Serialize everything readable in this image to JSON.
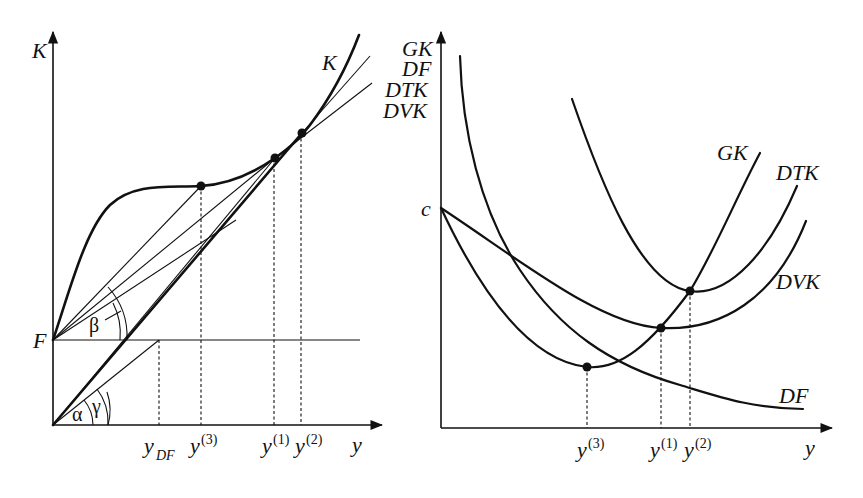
{
  "left_panel": {
    "y_axis_label": "K",
    "x_axis_label": "y",
    "fixed_cost_label": "F",
    "curve_label": "K",
    "angle_labels": {
      "alpha": "α",
      "gamma": "γ",
      "beta": "β"
    },
    "x_ticks": [
      {
        "base": "y",
        "sub": "DF",
        "sup": ""
      },
      {
        "base": "y",
        "sub": "",
        "sup": "(3)"
      },
      {
        "base": "y",
        "sub": "",
        "sup": "(1)"
      },
      {
        "base": "y",
        "sub": "",
        "sup": "(2)"
      }
    ]
  },
  "right_panel": {
    "y_axis_labels": [
      "GK",
      "DF",
      "DTK",
      "DVK"
    ],
    "x_axis_label": "y",
    "intercept_label": "c",
    "curve_labels": {
      "gk": "GK",
      "dtk": "DTK",
      "dvk": "DVK",
      "df": "DF"
    },
    "x_ticks": [
      {
        "base": "y",
        "sup": "(3)"
      },
      {
        "base": "y",
        "sup": "(1)"
      },
      {
        "base": "y",
        "sup": "(2)"
      }
    ]
  }
}
